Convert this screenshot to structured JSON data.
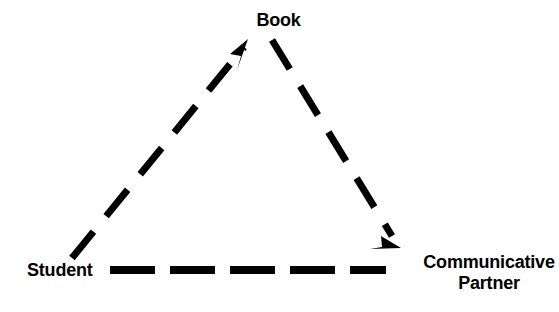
{
  "diagram": {
    "type": "triangle-relationship",
    "background_color": "#ffffff",
    "stroke_color": "#000000",
    "nodes": [
      {
        "id": "book",
        "label": "Book",
        "position": "top"
      },
      {
        "id": "student",
        "label": "Student",
        "position": "bottom-left"
      },
      {
        "id": "partner",
        "label_line1": "Communicative",
        "label_line2": "Partner",
        "position": "bottom-right"
      }
    ],
    "edges": [
      {
        "id": "student-to-book",
        "from": "Student",
        "to": "Book",
        "style": "dashed",
        "arrowhead": "end"
      },
      {
        "id": "book-to-partner",
        "from": "Book",
        "to": "Communicative Partner",
        "style": "dashed",
        "arrowhead": "end"
      },
      {
        "id": "student-to-partner",
        "from": "Student",
        "to": "Communicative Partner",
        "style": "dashed",
        "arrowhead": "none"
      }
    ]
  }
}
